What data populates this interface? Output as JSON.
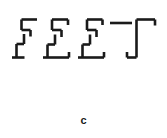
{
  "panel": {
    "caption": "c",
    "word": "FEET",
    "background_color": "#ffffff",
    "stroke_color": "#1a1a1a",
    "stroke_width": 2.6,
    "width": 167,
    "height": 138,
    "style_description": "fragmented offset line-segment letters"
  },
  "letters": [
    {
      "char": "F",
      "name": "letter-f-1",
      "segments": [
        {
          "name": "f1-top-bar",
          "x1": 21.5,
          "y1": 19.5,
          "x2": 37.0,
          "y2": 19.5
        },
        {
          "name": "f1-upper-stem",
          "x1": 21.5,
          "y1": 19.5,
          "x2": 21.5,
          "y2": 30.0
        },
        {
          "name": "f1-mid-bar",
          "x1": 21.5,
          "y1": 30.0,
          "x2": 30.5,
          "y2": 30.0
        },
        {
          "name": "f1-mid-tick",
          "x1": 30.5,
          "y1": 30.0,
          "x2": 30.5,
          "y2": 36.5
        },
        {
          "name": "f1-lower-stem-top",
          "x1": 24.0,
          "y1": 34.0,
          "x2": 24.0,
          "y2": 44.0
        },
        {
          "name": "f1-lower-jog",
          "x1": 16.5,
          "y1": 44.0,
          "x2": 24.0,
          "y2": 44.0
        },
        {
          "name": "f1-lower-stem",
          "x1": 16.5,
          "y1": 44.0,
          "x2": 16.5,
          "y2": 57.5
        },
        {
          "name": "f1-foot-bar",
          "x1": 12.0,
          "y1": 57.5,
          "x2": 24.5,
          "y2": 57.5
        }
      ]
    },
    {
      "char": "E",
      "name": "letter-e-1",
      "segments": [
        {
          "name": "e1-top-bar",
          "x1": 52.0,
          "y1": 19.5,
          "x2": 68.0,
          "y2": 19.5
        },
        {
          "name": "e1-top-stem",
          "x1": 68.0,
          "y1": 19.5,
          "x2": 68.0,
          "y2": 25.0
        },
        {
          "name": "e1-upper-stem",
          "x1": 52.0,
          "y1": 19.5,
          "x2": 52.0,
          "y2": 30.0
        },
        {
          "name": "e1-mid-bar",
          "x1": 52.0,
          "y1": 30.0,
          "x2": 61.5,
          "y2": 30.0
        },
        {
          "name": "e1-mid-tick",
          "x1": 61.5,
          "y1": 30.0,
          "x2": 61.5,
          "y2": 37.0
        },
        {
          "name": "e1-mid-stem",
          "x1": 55.0,
          "y1": 34.5,
          "x2": 55.0,
          "y2": 44.5
        },
        {
          "name": "e1-lower-jog",
          "x1": 47.5,
          "y1": 44.5,
          "x2": 55.0,
          "y2": 44.5
        },
        {
          "name": "e1-lower-stem",
          "x1": 47.5,
          "y1": 44.5,
          "x2": 47.5,
          "y2": 57.5
        },
        {
          "name": "e1-foot-bar",
          "x1": 43.0,
          "y1": 57.5,
          "x2": 69.0,
          "y2": 57.5
        },
        {
          "name": "e1-foot-tick",
          "x1": 69.0,
          "y1": 52.0,
          "x2": 69.0,
          "y2": 57.5
        }
      ]
    },
    {
      "char": "E",
      "name": "letter-e-2",
      "segments": [
        {
          "name": "e2-top-bar",
          "x1": 87.0,
          "y1": 19.5,
          "x2": 102.5,
          "y2": 19.5
        },
        {
          "name": "e2-top-stem",
          "x1": 102.5,
          "y1": 19.5,
          "x2": 102.5,
          "y2": 25.0
        },
        {
          "name": "e2-upper-stem",
          "x1": 87.0,
          "y1": 19.5,
          "x2": 87.0,
          "y2": 30.0
        },
        {
          "name": "e2-mid-bar",
          "x1": 87.0,
          "y1": 30.0,
          "x2": 96.5,
          "y2": 30.0
        },
        {
          "name": "e2-mid-tick",
          "x1": 96.5,
          "y1": 30.0,
          "x2": 96.5,
          "y2": 37.0
        },
        {
          "name": "e2-mid-stem",
          "x1": 90.0,
          "y1": 34.5,
          "x2": 90.0,
          "y2": 44.5
        },
        {
          "name": "e2-lower-jog",
          "x1": 82.5,
          "y1": 44.5,
          "x2": 90.0,
          "y2": 44.5
        },
        {
          "name": "e2-lower-stem",
          "x1": 82.5,
          "y1": 44.5,
          "x2": 82.5,
          "y2": 57.5
        },
        {
          "name": "e2-foot-bar",
          "x1": 78.0,
          "y1": 57.5,
          "x2": 104.0,
          "y2": 57.5
        },
        {
          "name": "e2-foot-tick",
          "x1": 104.0,
          "y1": 52.0,
          "x2": 104.0,
          "y2": 57.5
        }
      ]
    },
    {
      "char": "T",
      "name": "letter-t-1",
      "segments": [
        {
          "name": "t1-cross-left",
          "x1": 110.0,
          "y1": 23.0,
          "x2": 132.0,
          "y2": 23.0
        },
        {
          "name": "t1-cross-right",
          "x1": 136.5,
          "y1": 19.5,
          "x2": 155.0,
          "y2": 19.5
        },
        {
          "name": "t1-right-tick",
          "x1": 155.0,
          "y1": 19.5,
          "x2": 155.0,
          "y2": 25.5
        },
        {
          "name": "t1-stem",
          "x1": 136.5,
          "y1": 19.5,
          "x2": 136.5,
          "y2": 57.5
        },
        {
          "name": "t1-foot-bar",
          "x1": 127.0,
          "y1": 57.5,
          "x2": 136.5,
          "y2": 57.5
        },
        {
          "name": "t1-foot-tick",
          "x1": 127.0,
          "y1": 52.0,
          "x2": 127.0,
          "y2": 57.5
        }
      ]
    }
  ]
}
